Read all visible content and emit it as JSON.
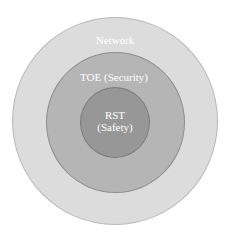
{
  "diagram": {
    "type": "concentric-circles",
    "layers": [
      {
        "id": "outer",
        "label": "Network",
        "fill": "#dcdcdc"
      },
      {
        "id": "middle",
        "label": "TOE (Security)",
        "fill": "#b5b5b5"
      },
      {
        "id": "inner",
        "label_line1": "RST",
        "label_line2": "(Safety)",
        "fill": "#979797"
      }
    ],
    "text_color": "#ffffff"
  }
}
